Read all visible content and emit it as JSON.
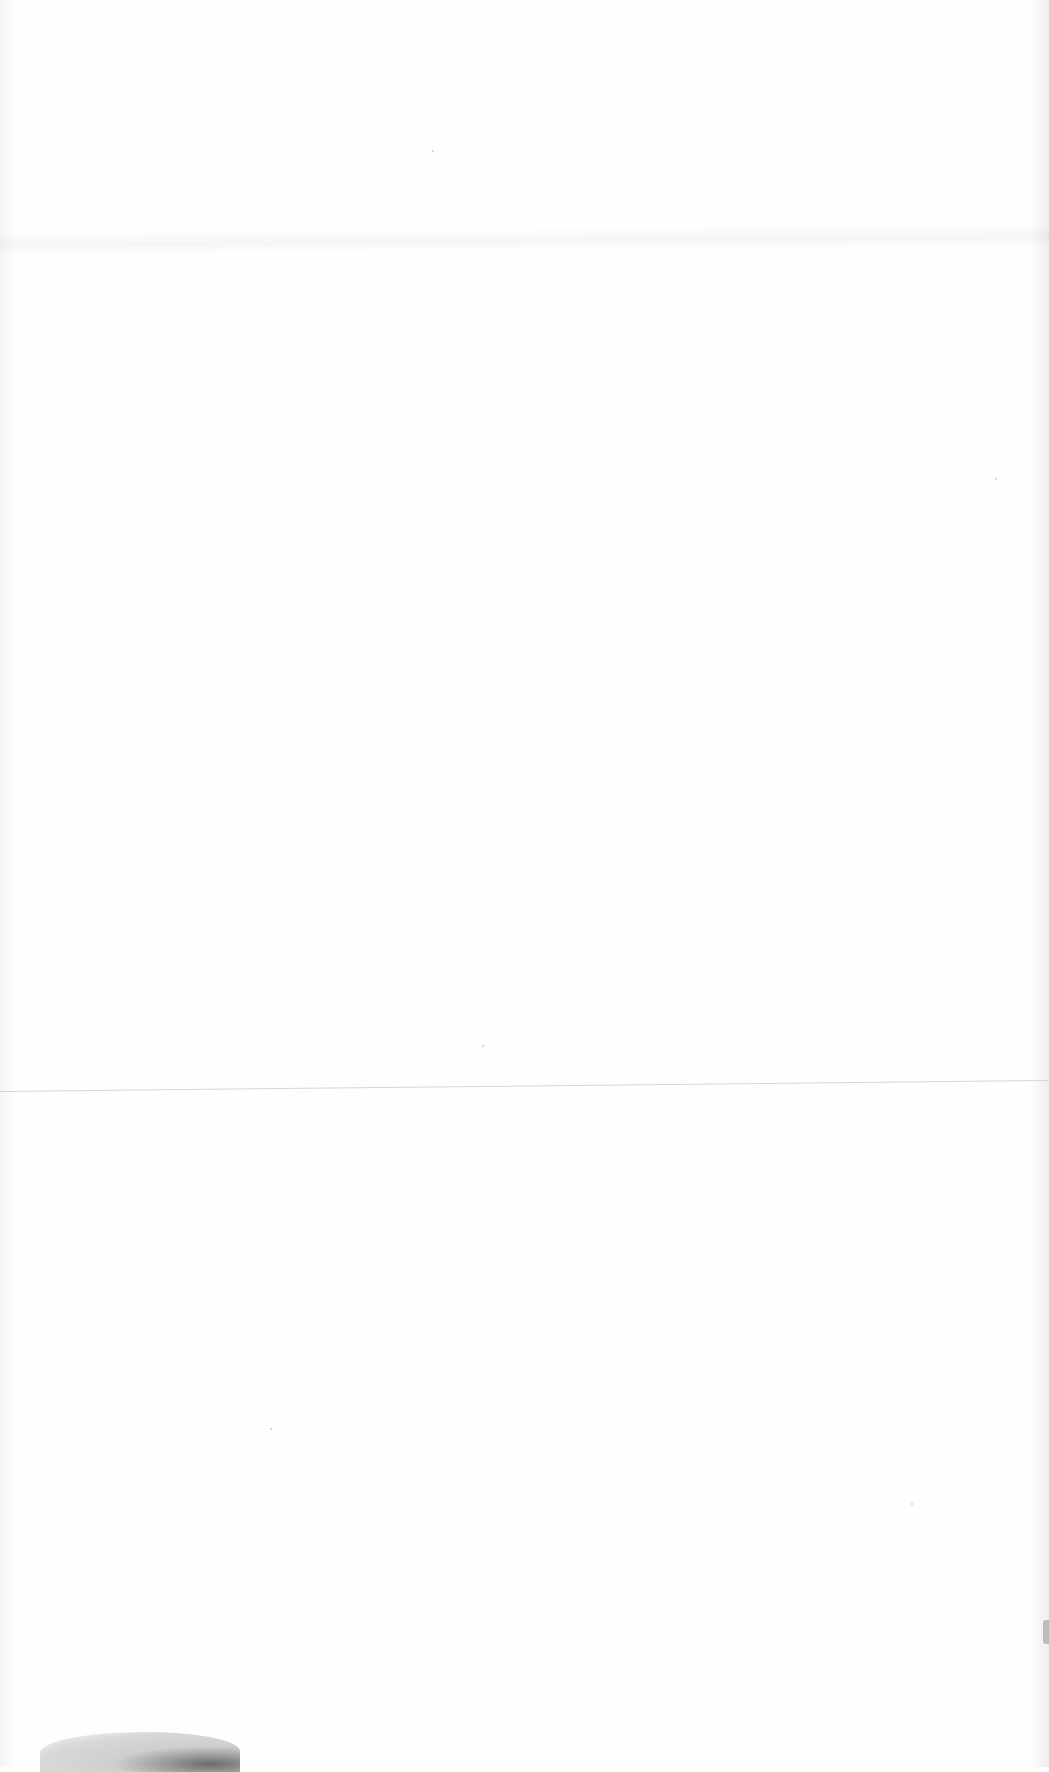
{
  "document": {
    "type": "blank scanned page",
    "text": "",
    "artifacts": [
      {
        "kind": "fold-line",
        "position": "upper"
      },
      {
        "kind": "fold-line",
        "position": "middle"
      },
      {
        "kind": "smudge",
        "position": "bottom-left"
      },
      {
        "kind": "edge-mark",
        "position": "right-edge-lower"
      }
    ]
  }
}
